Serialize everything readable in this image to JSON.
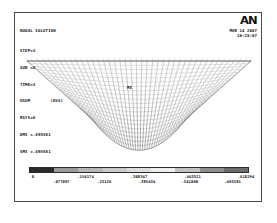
{
  "window": {
    "title": "ANSYS Nodal Solution Plot"
  },
  "header": {
    "title": "NODAL SOLUTION",
    "lines": [
      {
        "key": "STEP=3"
      },
      {
        "key": "SUB =4"
      },
      {
        "key": "TIME=3"
      },
      {
        "key": "USUM",
        "value": "(AVG)"
      },
      {
        "key": "RSYS=0"
      },
      {
        "key": "DMX =.495581"
      },
      {
        "key": "SMX =.495581"
      }
    ]
  },
  "logo": {
    "mark": "AN",
    "date": "MAR 14 2007",
    "time": "16:15:07"
  },
  "plot": {
    "mx_marker": "MX",
    "description": "Deformed finite-element shell mesh, bowl/saddle shaped, grayscale contour shading"
  },
  "legend": {
    "colors": [
      "#2b2b2b",
      "#9a9a9a",
      "#b6b6b6",
      "#c9c9c9",
      "#dcdcdc",
      "#efefef",
      "#c2c2c2",
      "#8e8e8e",
      "#6b6b6b"
    ],
    "upper_ticks": [
      "0",
      ".154174",
      ".308347",
      ".463521",
      ".618294"
    ],
    "lower_ticks": [
      ".077087",
      ".23126",
      ".385434",
      ".541000",
      ".495581"
    ]
  },
  "chart_data": {
    "type": "heatmap",
    "title": "NODAL SOLUTION",
    "subtitle": "USUM (AVG)",
    "xlabel": "",
    "ylabel": "",
    "legend_position": "bottom",
    "grid": false,
    "colormap": "grayscale",
    "contour_bands": 9,
    "contour_values": [
      0.0,
      0.077087,
      0.154174,
      0.23126,
      0.308347,
      0.385434,
      0.463721,
      0.541,
      0.618294,
      0.495581
    ],
    "value_min": 0.0,
    "value_max": 0.495581,
    "dmx": 0.495581,
    "smx": 0.495581,
    "step": 3,
    "sub": 4,
    "time": 3,
    "rsys": 0
  }
}
